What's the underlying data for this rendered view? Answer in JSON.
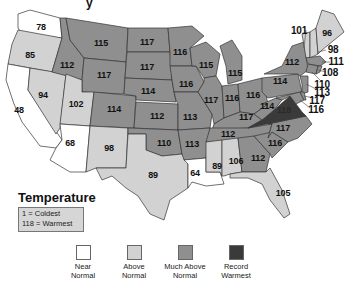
{
  "title_fragment": "y",
  "legend": {
    "title": "Temperature",
    "scale_lines": [
      "1 = Coldest",
      "118 = Warmest"
    ],
    "categories": [
      {
        "label_line1": "Near",
        "label_line2": "Normal",
        "color": "#ffffff"
      },
      {
        "label_line1": "Above",
        "label_line2": "Normal",
        "color": "#d2d2d2"
      },
      {
        "label_line1": "Much Above",
        "label_line2": "Normal",
        "color": "#8f8f8f"
      },
      {
        "label_line1": "Record",
        "label_line2": "Warmest",
        "color": "#3a3a3a"
      }
    ]
  },
  "states": [
    {
      "abbr": "WA",
      "rank": "78",
      "category": "near"
    },
    {
      "abbr": "OR",
      "rank": "85",
      "category": "above"
    },
    {
      "abbr": "CA",
      "rank": "48",
      "category": "near"
    },
    {
      "abbr": "NV",
      "rank": "94",
      "category": "above"
    },
    {
      "abbr": "ID",
      "rank": "112",
      "category": "much"
    },
    {
      "abbr": "MT",
      "rank": "115",
      "category": "much"
    },
    {
      "abbr": "WY",
      "rank": "117",
      "category": "much"
    },
    {
      "abbr": "UT",
      "rank": "102",
      "category": "above"
    },
    {
      "abbr": "AZ",
      "rank": "68",
      "category": "near"
    },
    {
      "abbr": "CO",
      "rank": "114",
      "category": "much"
    },
    {
      "abbr": "NM",
      "rank": "98",
      "category": "above"
    },
    {
      "abbr": "ND",
      "rank": "117",
      "category": "much"
    },
    {
      "abbr": "SD",
      "rank": "117",
      "category": "much"
    },
    {
      "abbr": "NE",
      "rank": "114",
      "category": "much"
    },
    {
      "abbr": "KS",
      "rank": "112",
      "category": "much"
    },
    {
      "abbr": "OK",
      "rank": "110",
      "category": "much"
    },
    {
      "abbr": "TX",
      "rank": "89",
      "category": "above"
    },
    {
      "abbr": "MN",
      "rank": "116",
      "category": "much"
    },
    {
      "abbr": "IA",
      "rank": "116",
      "category": "much"
    },
    {
      "abbr": "MO",
      "rank": "113",
      "category": "much"
    },
    {
      "abbr": "AR",
      "rank": "113",
      "category": "much"
    },
    {
      "abbr": "LA",
      "rank": "64",
      "category": "near"
    },
    {
      "abbr": "WI",
      "rank": "115",
      "category": "much"
    },
    {
      "abbr": "IL",
      "rank": "117",
      "category": "much"
    },
    {
      "abbr": "MI",
      "rank": "115",
      "category": "much"
    },
    {
      "abbr": "IN",
      "rank": "116",
      "category": "much"
    },
    {
      "abbr": "OH",
      "rank": "116",
      "category": "much"
    },
    {
      "abbr": "KY",
      "rank": "117",
      "category": "much"
    },
    {
      "abbr": "TN",
      "rank": "112",
      "category": "much"
    },
    {
      "abbr": "MS",
      "rank": "89",
      "category": "above"
    },
    {
      "abbr": "AL",
      "rank": "106",
      "category": "above"
    },
    {
      "abbr": "GA",
      "rank": "112",
      "category": "much"
    },
    {
      "abbr": "FL",
      "rank": "105",
      "category": "above"
    },
    {
      "abbr": "SC",
      "rank": "116",
      "category": "much"
    },
    {
      "abbr": "NC",
      "rank": "117",
      "category": "much"
    },
    {
      "abbr": "VA",
      "rank": "118",
      "category": "record"
    },
    {
      "abbr": "WV",
      "rank": "114",
      "category": "much"
    },
    {
      "abbr": "PA",
      "rank": "114",
      "category": "much"
    },
    {
      "abbr": "NY",
      "rank": "112",
      "category": "much"
    },
    {
      "abbr": "VT",
      "rank": "101",
      "category": "above"
    },
    {
      "abbr": "NH",
      "rank": "98",
      "category": "above"
    },
    {
      "abbr": "ME",
      "rank": "96",
      "category": "above"
    },
    {
      "abbr": "MA",
      "rank": "111",
      "category": "much"
    },
    {
      "abbr": "RI",
      "rank": "108",
      "category": "much"
    },
    {
      "abbr": "CT",
      "rank": "110",
      "category": "much"
    },
    {
      "abbr": "NJ",
      "rank": "113",
      "category": "much"
    },
    {
      "abbr": "DE",
      "rank": "117",
      "category": "much"
    },
    {
      "abbr": "MD",
      "rank": "116",
      "category": "much"
    }
  ]
}
